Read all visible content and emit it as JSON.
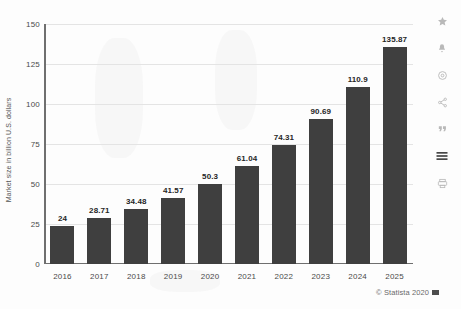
{
  "chart_data": {
    "type": "bar",
    "title": "",
    "xlabel": "",
    "ylabel": "Market size in billion U.S. dollars",
    "categories": [
      "2016",
      "2017",
      "2018",
      "2019",
      "2020",
      "2021",
      "2022",
      "2023",
      "2024",
      "2025"
    ],
    "values": [
      24,
      28.71,
      34.48,
      41.57,
      50.3,
      61.04,
      74.31,
      90.69,
      110.9,
      135.87
    ],
    "value_labels": [
      "24",
      "28.71",
      "34.48",
      "41.57",
      "50.3",
      "61.04",
      "74.31",
      "90.69",
      "110.9",
      "135.87"
    ],
    "yticks": [
      0,
      25,
      50,
      75,
      100,
      125,
      150
    ],
    "ytick_labels": [
      "0",
      "25",
      "50",
      "75",
      "100",
      "125",
      "150"
    ],
    "ylim": [
      0,
      150
    ],
    "grid": true,
    "legend": "none",
    "bar_color": "#3f3f3f",
    "grid_color": "#e4e4e4",
    "axis_color": "#6f6f6f"
  },
  "toolbar": {
    "items": [
      {
        "name": "favorite-icon",
        "label": "Favorite"
      },
      {
        "name": "bell-icon",
        "label": "Notifications"
      },
      {
        "name": "gear-icon",
        "label": "Settings"
      },
      {
        "name": "share-icon",
        "label": "Share"
      },
      {
        "name": "quote-icon",
        "label": "Citation"
      },
      {
        "name": "list-icon",
        "label": "Data table"
      },
      {
        "name": "print-icon",
        "label": "Print"
      }
    ]
  },
  "footer": {
    "credit": "© Statista 2020",
    "flag_icon": "flag-icon"
  }
}
